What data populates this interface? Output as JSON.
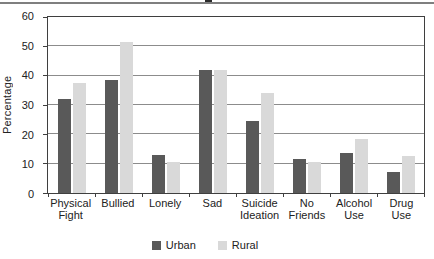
{
  "chart_data": {
    "type": "bar",
    "title": "",
    "categories": [
      "Physical Fight",
      "Bullied",
      "Lonely",
      "Sad",
      "Suicide Ideation",
      "No Friends",
      "Alcohol Use",
      "Drug Use"
    ],
    "category_lines": [
      [
        "Physical",
        "Fight"
      ],
      [
        "Bullied"
      ],
      [
        "Lonely"
      ],
      [
        "Sad"
      ],
      [
        "Suicide",
        "Ideation"
      ],
      [
        "No",
        "Friends"
      ],
      [
        "Alcohol",
        "Use"
      ],
      [
        "Drug",
        "Use"
      ]
    ],
    "series": [
      {
        "name": "Urban",
        "color": "#595959",
        "values": [
          32,
          38.5,
          13,
          42,
          24.5,
          11.5,
          13.5,
          7
        ]
      },
      {
        "name": "Rural",
        "color": "#d9d9d9",
        "values": [
          37.5,
          51.5,
          10.5,
          42,
          34,
          10.5,
          18.5,
          12.5
        ]
      }
    ],
    "xlabel": "",
    "ylabel": "Percentage",
    "ylim": [
      0,
      60
    ],
    "ytick_step": 10,
    "yticks": [
      0,
      10,
      20,
      30,
      40,
      50,
      60
    ],
    "grid": "horizontal",
    "legend_position": "bottom",
    "colors": {
      "gridline": "#8c8c8c",
      "frame": "#3f3f3f",
      "text": "#222222",
      "background": "#ffffff",
      "top_rule": "#7f7f7f"
    }
  }
}
